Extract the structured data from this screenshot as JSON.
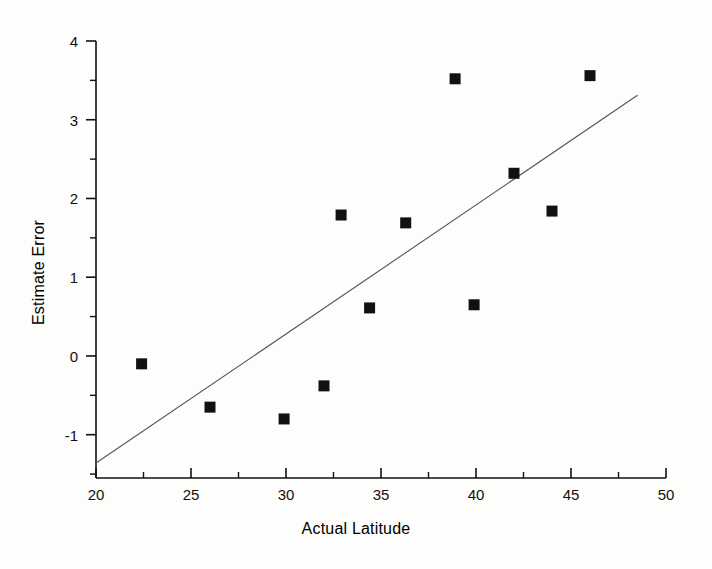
{
  "chart_data": {
    "type": "scatter",
    "title": "",
    "xlabel": "Actual Latitude",
    "ylabel": "Estimate Error",
    "xlim": [
      20,
      50
    ],
    "ylim": [
      -1.55,
      4.0
    ],
    "grid": false,
    "legend": null,
    "x_ticks": [
      "20",
      "25",
      "30",
      "35",
      "40",
      "45",
      "50"
    ],
    "x_tick_values": [
      20,
      25,
      30,
      35,
      40,
      45,
      50
    ],
    "x_minor_tick_values": [
      22.5,
      27.5,
      32.5,
      37.5,
      42.5,
      47.5
    ],
    "y_ticks": [
      "4",
      "3",
      "2",
      "1",
      "0",
      "-1"
    ],
    "y_tick_values": [
      4,
      3,
      2,
      1,
      0,
      -1
    ],
    "y_minor_tick_values": [
      3.5,
      2.5,
      1.5,
      0.5,
      -0.5,
      -1.5
    ],
    "marker": "square",
    "marker_color": "#111111",
    "marker_size": 11,
    "points": [
      {
        "x": 22.4,
        "y": -0.1
      },
      {
        "x": 26.0,
        "y": -0.65
      },
      {
        "x": 29.9,
        "y": -0.8
      },
      {
        "x": 32.0,
        "y": -0.38
      },
      {
        "x": 32.9,
        "y": 1.79
      },
      {
        "x": 34.4,
        "y": 0.61
      },
      {
        "x": 36.3,
        "y": 1.69
      },
      {
        "x": 38.9,
        "y": 3.52
      },
      {
        "x": 39.9,
        "y": 0.65
      },
      {
        "x": 42.0,
        "y": 2.32
      },
      {
        "x": 44.0,
        "y": 1.84
      },
      {
        "x": 46.0,
        "y": 3.56
      }
    ],
    "trendline": {
      "type": "linear-fit",
      "color": "#555555",
      "x_start": 20.0,
      "y_start": -1.36,
      "x_end": 48.5,
      "y_end": 3.31
    }
  },
  "axis": {
    "x_axis_name": "x-axis",
    "y_axis_name": "y-axis"
  }
}
